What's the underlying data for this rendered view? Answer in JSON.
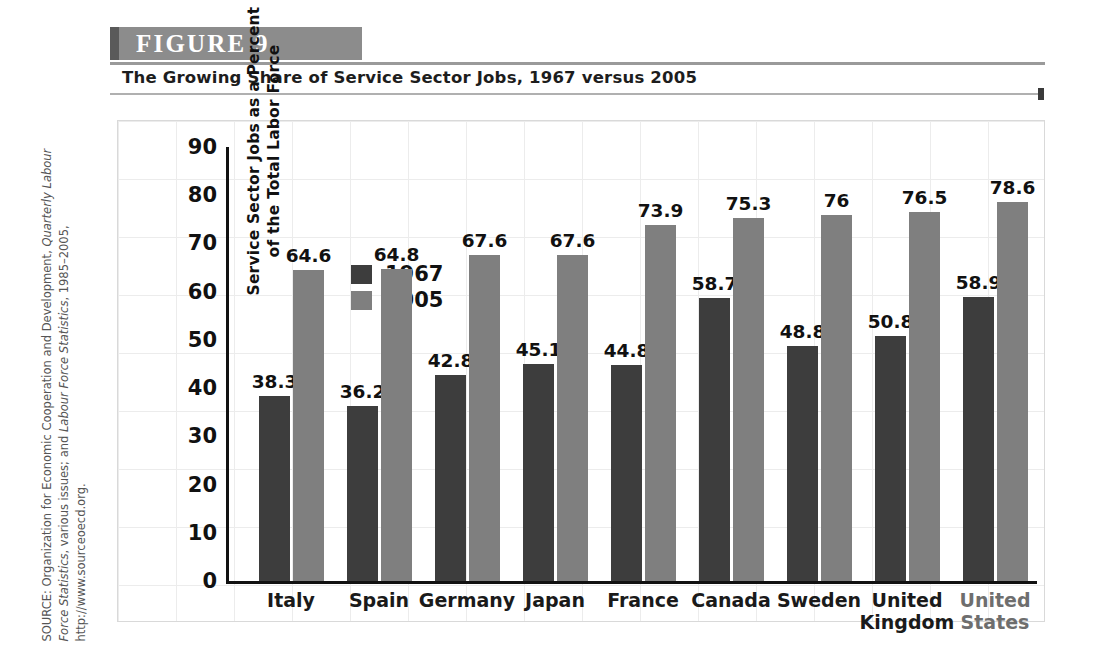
{
  "figure": {
    "header_label": "FIGURE  9",
    "caption": "The Growing Share of Service Sector Jobs, 1967 versus 2005",
    "source_prefix": "SOURCE: Organization for Economic Cooperation and Development, ",
    "source_italic_1": "Quarterly Labour Force Statistics",
    "source_mid": ", various issues; and ",
    "source_italic_2": "Labour Force Statistics",
    "source_suffix": ", 1985–2005, http://www.sourceoecd.org."
  },
  "colors": {
    "series_1967": "#3d3d3d",
    "series_2005": "#7f7f7f",
    "header_bar": "#8c8c8c",
    "axis": "#111111",
    "grid": "#ececec"
  },
  "chart_data": {
    "type": "bar",
    "title": "The Growing Share of Service Sector Jobs, 1967 versus 2005",
    "xlabel": "",
    "ylabel": "Service Sector Jobs as a Percent of the Total Labor Force",
    "ylabel_line1": "Service Sector Jobs as a Percent",
    "ylabel_line2": "of the Total Labor Force",
    "ylim": [
      0,
      90
    ],
    "yticks": [
      0,
      10,
      20,
      30,
      40,
      50,
      60,
      70,
      80,
      90
    ],
    "ytick_labels": [
      "0",
      "10",
      "20",
      "30",
      "40",
      "50",
      "60",
      "70",
      "80",
      "90"
    ],
    "grid": true,
    "legend_position": "upper-left-inside",
    "categories": [
      "Italy",
      "Spain",
      "Germany",
      "Japan",
      "France",
      "Canada",
      "Sweden",
      "United Kingdom",
      "United States"
    ],
    "category_lines": [
      [
        "Italy"
      ],
      [
        "Spain"
      ],
      [
        "Germany"
      ],
      [
        "Japan"
      ],
      [
        "France"
      ],
      [
        "Canada"
      ],
      [
        "Sweden"
      ],
      [
        "United",
        "Kingdom"
      ],
      [
        "United",
        "States"
      ]
    ],
    "series": [
      {
        "name": "1967",
        "color": "#3d3d3d",
        "values": [
          38.3,
          36.2,
          42.8,
          45.1,
          44.8,
          58.7,
          48.8,
          50.8,
          58.9
        ],
        "labels": [
          "38.3",
          "36.2",
          "42.8",
          "45.1",
          "44.8",
          "58.7",
          "48.8",
          "50.8",
          "58.9"
        ]
      },
      {
        "name": "2005",
        "color": "#7f7f7f",
        "values": [
          64.6,
          64.8,
          67.6,
          67.6,
          73.9,
          75.3,
          76,
          76.5,
          78.6
        ],
        "labels": [
          "64.6",
          "64.8",
          "67.6",
          "67.6",
          "73.9",
          "75.3",
          "76",
          "76.5",
          "78.6"
        ]
      }
    ],
    "legend": [
      "1967",
      "2005"
    ]
  }
}
